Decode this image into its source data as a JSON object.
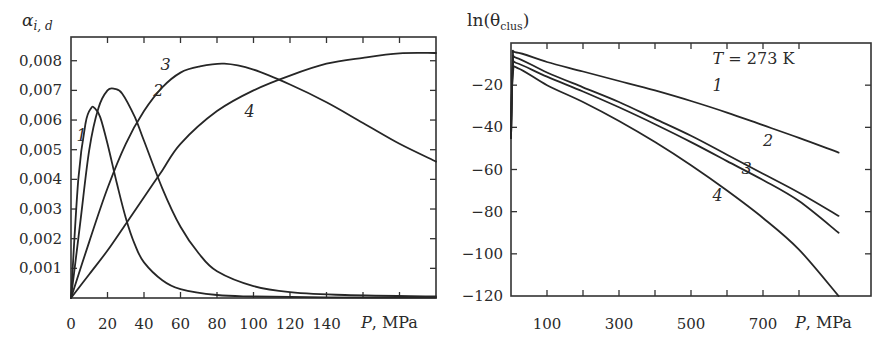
{
  "chart_data": [
    {
      "type": "line",
      "title": "",
      "ylabel": "α_{i,d}",
      "ylabel_main": "α",
      "ylabel_sub": "i, d",
      "xlabel": "P, MPa",
      "xlabel_var": "P",
      "xlabel_unit": ", MPa",
      "xlim": [
        0,
        200
      ],
      "ylim": [
        0,
        0.0088
      ],
      "x_ticks": [
        0,
        20,
        40,
        60,
        80,
        100,
        120,
        140,
        160,
        180
      ],
      "x_tick_labels": [
        "0",
        "20",
        "40",
        "60",
        "80",
        "100",
        "120",
        "140"
      ],
      "y_ticks": [
        0.001,
        0.002,
        0.003,
        0.004,
        0.005,
        0.006,
        0.007,
        0.008
      ],
      "y_tick_labels": [
        "0,001",
        "0,002",
        "0,003",
        "0,004",
        "0,005",
        "0,006",
        "0,007",
        "0,008"
      ],
      "grid": false,
      "series": [
        {
          "name": "1",
          "x": [
            0,
            4,
            8,
            11,
            13,
            16,
            20,
            25,
            30,
            35,
            40,
            50,
            60,
            80,
            100,
            140,
            200
          ],
          "values": [
            0,
            0.004,
            0.0059,
            0.0064,
            0.0064,
            0.0061,
            0.0052,
            0.0039,
            0.0027,
            0.0018,
            0.0012,
            0.0006,
            0.0003,
            0.0001,
            5e-05,
            2e-05,
            1e-05
          ]
        },
        {
          "name": "2",
          "x": [
            0,
            5,
            10,
            15,
            20,
            24,
            28,
            35,
            40,
            50,
            60,
            70,
            80,
            100,
            120,
            150,
            200
          ],
          "values": [
            0,
            0.0025,
            0.005,
            0.0064,
            0.007,
            0.00705,
            0.0069,
            0.0061,
            0.0053,
            0.0037,
            0.0024,
            0.0015,
            0.0009,
            0.0004,
            0.0002,
            0.0001,
            5e-05
          ]
        },
        {
          "name": "3",
          "x": [
            0,
            10,
            20,
            30,
            40,
            50,
            60,
            70,
            84,
            100,
            120,
            140,
            160,
            180,
            200
          ],
          "values": [
            0,
            0.0019,
            0.0037,
            0.0052,
            0.0063,
            0.0071,
            0.0076,
            0.0078,
            0.0079,
            0.0077,
            0.0072,
            0.0066,
            0.0059,
            0.0052,
            0.0046
          ]
        },
        {
          "name": "4",
          "x": [
            0,
            10,
            20,
            30,
            40,
            50,
            60,
            80,
            100,
            120,
            140,
            160,
            180,
            200
          ],
          "values": [
            0,
            0.0008,
            0.0016,
            0.0025,
            0.0034,
            0.0043,
            0.0052,
            0.0063,
            0.007,
            0.0075,
            0.0079,
            0.0081,
            0.00825,
            0.00826
          ]
        }
      ],
      "annotations": [
        {
          "text": "1",
          "x": 3,
          "y": 0.0053
        },
        {
          "text": "2",
          "x": 45,
          "y": 0.0068
        },
        {
          "text": "3",
          "x": 49,
          "y": 0.0077
        },
        {
          "text": "4",
          "x": 95,
          "y": 0.0061
        }
      ]
    },
    {
      "type": "line",
      "title": "",
      "ylabel": "ln(θ_clus)",
      "ylabel_main": "ln(θ",
      "ylabel_sub": "clus",
      "ylabel_close": ")",
      "xlabel": "P, MPa",
      "xlabel_var": "P",
      "xlabel_unit": ", MPa",
      "xlim": [
        0,
        1000
      ],
      "ylim": [
        -120,
        0
      ],
      "x_ticks": [
        100,
        200,
        300,
        400,
        500,
        600,
        700,
        800
      ],
      "x_tick_labels": [
        "100",
        "300",
        "500",
        "700"
      ],
      "y_ticks": [
        -20,
        -40,
        -60,
        -80,
        -100,
        -120
      ],
      "y_tick_labels": [
        "−20",
        "−40",
        "−60",
        "−80",
        "−100",
        "−120"
      ],
      "grid": false,
      "series": [
        {
          "name": "1",
          "x": [
            0,
            5,
            15,
            100,
            200,
            300,
            400,
            500,
            600,
            700,
            800,
            910
          ],
          "values": [
            -45,
            -8,
            -4.5,
            -9,
            -13.5,
            -18,
            -22.5,
            -27.5,
            -33,
            -39,
            -45,
            -52
          ]
        },
        {
          "name": "2",
          "x": [
            0,
            5,
            15,
            100,
            200,
            300,
            400,
            500,
            600,
            700,
            800,
            910
          ],
          "values": [
            -45,
            -10,
            -7,
            -14,
            -21,
            -28,
            -36,
            -44,
            -53,
            -62,
            -71,
            -82
          ]
        },
        {
          "name": "3",
          "x": [
            0,
            5,
            15,
            100,
            200,
            300,
            400,
            500,
            600,
            700,
            800,
            910
          ],
          "values": [
            -45,
            -12,
            -9.5,
            -16,
            -23,
            -30.5,
            -38.5,
            -47,
            -56,
            -65,
            -75,
            -90
          ]
        },
        {
          "name": "4",
          "x": [
            0,
            5,
            20,
            100,
            200,
            300,
            400,
            500,
            600,
            700,
            800,
            910
          ],
          "values": [
            -45,
            -15,
            -12,
            -20,
            -28,
            -37,
            -47,
            -58,
            -70,
            -83,
            -98,
            -120
          ]
        }
      ],
      "annotations": [
        {
          "text": "T = 273 K",
          "x": 560,
          "y": -10
        },
        {
          "text": "1",
          "x": 560,
          "y": -23
        },
        {
          "text": "2",
          "x": 700,
          "y": -49
        },
        {
          "text": "3",
          "x": 640,
          "y": -62
        },
        {
          "text": "4",
          "x": 560,
          "y": -75
        }
      ]
    }
  ]
}
